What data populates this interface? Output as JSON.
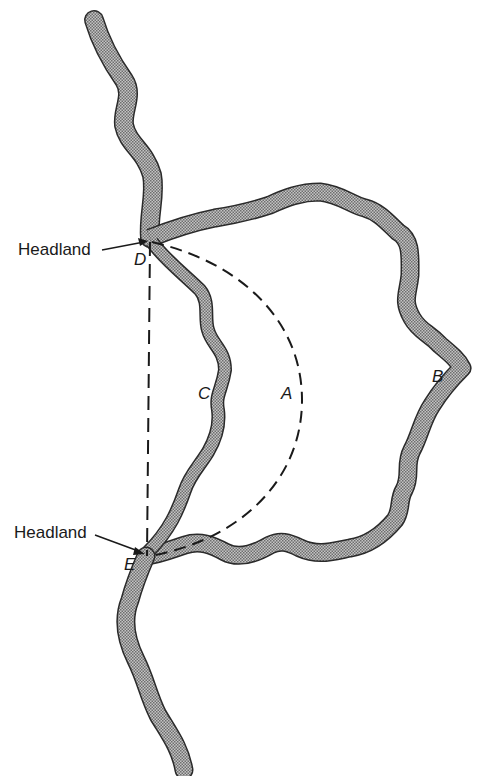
{
  "diagram": {
    "type": "coastline-schematic",
    "labels": {
      "headland_top": "Headland",
      "headland_bottom": "Headland",
      "point_d": "D",
      "point_e": "E",
      "line_a": "A",
      "line_b": "B",
      "line_c": "C"
    },
    "colors": {
      "coast_fill": "#9a9a9a",
      "coast_edge": "#2a2a2a",
      "dash_line": "#1a1a1a",
      "text": "#1a1a1a",
      "background": "#ffffff"
    },
    "elements": [
      {
        "id": "D",
        "role": "headland point",
        "x": 148,
        "y": 242
      },
      {
        "id": "E",
        "role": "headland point",
        "x": 146,
        "y": 556
      },
      {
        "id": "A",
        "role": "dashed circular arc between headlands"
      },
      {
        "id": "B",
        "role": "deeply indented outer coastline"
      },
      {
        "id": "C",
        "role": "shallow indented inner coastline"
      },
      {
        "id": "DE",
        "role": "dashed straight chord between headlands"
      }
    ]
  }
}
